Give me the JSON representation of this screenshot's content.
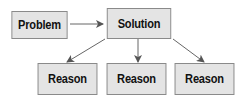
{
  "diagram": {
    "nodes": {
      "problem": {
        "label": "Problem"
      },
      "solution": {
        "label": "Solution"
      },
      "reason1": {
        "label": "Reason"
      },
      "reason2": {
        "label": "Reason"
      },
      "reason3": {
        "label": "Reason"
      }
    },
    "edges": [
      {
        "from": "problem",
        "to": "solution"
      },
      {
        "from": "solution",
        "to": "reason1"
      },
      {
        "from": "solution",
        "to": "reason2"
      },
      {
        "from": "solution",
        "to": "reason3"
      }
    ],
    "colors": {
      "box_fill": "#e4e4e4",
      "box_border": "#8a8a8a",
      "arrow": "#555555"
    }
  }
}
